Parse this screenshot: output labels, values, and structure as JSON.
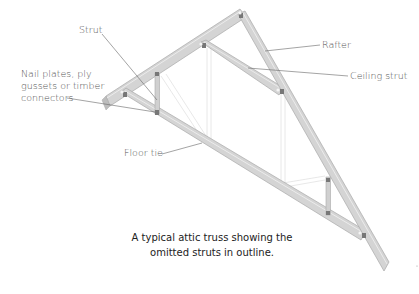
{
  "diagram": {
    "title": "Attic truss",
    "colors": {
      "member_fill": "#d2d2d2",
      "member_edge": "#a9a9a9",
      "member_highlight": "#ebebeb",
      "outline": "#e2e2e2",
      "leader": "#666666",
      "label_text": "#555555",
      "caption_text": "#222222"
    },
    "labels": {
      "strut": "Strut",
      "rafter": "Rafter",
      "ceiling_strut": "Ceiling strut",
      "nail_plates_line1": "Nail plates, ply",
      "nail_plates_line2": "gussets or timber",
      "nail_plates_line3": "connectors",
      "floor_tie": "Floor tie"
    },
    "caption": {
      "line1": "A typical attic truss showing the",
      "line2": "omitted struts in outline."
    },
    "members": [
      {
        "name": "left-rafter",
        "from": [
          106,
          103
        ],
        "to": [
          241,
          15
        ]
      },
      {
        "name": "right-rafter",
        "from": [
          241,
          15
        ],
        "to": [
          384,
          268
        ]
      },
      {
        "name": "floor-tie",
        "from": [
          124,
          94
        ],
        "to": [
          363,
          236
        ]
      },
      {
        "name": "ceiling-strut",
        "from": [
          203,
          45
        ],
        "to": [
          281,
          92
        ]
      },
      {
        "name": "left-vertical-strut",
        "from": [
          157,
          73
        ],
        "to": [
          157,
          113
        ]
      },
      {
        "name": "right-vertical-strut",
        "from": [
          328,
          178
        ],
        "to": [
          328,
          214
        ]
      }
    ]
  }
}
